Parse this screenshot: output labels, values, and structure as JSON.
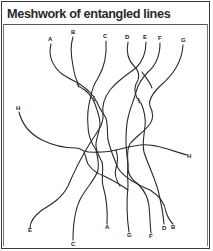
{
  "figure": {
    "title": "Meshwork of entangled lines",
    "top_labels": [
      {
        "id": "A",
        "x": 50,
        "y": 40
      },
      {
        "id": "B",
        "x": 73,
        "y": 33
      },
      {
        "id": "C",
        "x": 105,
        "y": 37
      },
      {
        "id": "D",
        "x": 127,
        "y": 38
      },
      {
        "id": "E",
        "x": 145,
        "y": 38
      },
      {
        "id": "F",
        "x": 160,
        "y": 39
      },
      {
        "id": "G",
        "x": 183,
        "y": 41
      }
    ],
    "side_labels": [
      {
        "id": "H",
        "x": 18,
        "y": 108
      },
      {
        "id": "H",
        "x": 188,
        "y": 157
      }
    ],
    "bottom_labels": [
      {
        "id": "E",
        "x": 30,
        "y": 231
      },
      {
        "id": "C",
        "x": 73,
        "y": 245
      },
      {
        "id": "A",
        "x": 107,
        "y": 228
      },
      {
        "id": "G",
        "x": 129,
        "y": 236
      },
      {
        "id": "F",
        "x": 151,
        "y": 237
      },
      {
        "id": "D",
        "x": 164,
        "y": 229
      },
      {
        "id": "B",
        "x": 173,
        "y": 228
      }
    ]
  }
}
